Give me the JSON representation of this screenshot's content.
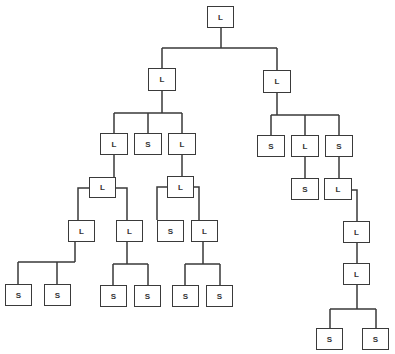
{
  "diagram": {
    "type": "tree",
    "colors": {
      "line": "#3a3a3a",
      "text": "#333333",
      "background": "#ffffff"
    },
    "nodes": [
      {
        "id": "n0",
        "label": "L",
        "x": 207,
        "y": 6,
        "w": 27,
        "h": 22
      },
      {
        "id": "n1",
        "label": "L",
        "x": 148,
        "y": 68,
        "w": 28,
        "h": 23
      },
      {
        "id": "n2",
        "label": "L",
        "x": 263,
        "y": 70,
        "w": 28,
        "h": 23
      },
      {
        "id": "n3",
        "label": "L",
        "x": 100,
        "y": 133,
        "w": 28,
        "h": 22
      },
      {
        "id": "n4",
        "label": "S",
        "x": 134,
        "y": 133,
        "w": 28,
        "h": 22
      },
      {
        "id": "n5",
        "label": "L",
        "x": 168,
        "y": 133,
        "w": 28,
        "h": 22
      },
      {
        "id": "n6",
        "label": "S",
        "x": 257,
        "y": 135,
        "w": 28,
        "h": 22
      },
      {
        "id": "n7",
        "label": "L",
        "x": 291,
        "y": 135,
        "w": 28,
        "h": 22
      },
      {
        "id": "n8",
        "label": "S",
        "x": 325,
        "y": 135,
        "w": 28,
        "h": 22
      },
      {
        "id": "n9",
        "label": "L",
        "x": 89,
        "y": 177,
        "w": 27,
        "h": 21
      },
      {
        "id": "n10",
        "label": "L",
        "x": 167,
        "y": 176,
        "w": 27,
        "h": 22
      },
      {
        "id": "n11",
        "label": "S",
        "x": 291,
        "y": 178,
        "w": 28,
        "h": 22
      },
      {
        "id": "n12",
        "label": "L",
        "x": 324,
        "y": 178,
        "w": 28,
        "h": 22
      },
      {
        "id": "n13",
        "label": "L",
        "x": 68,
        "y": 220,
        "w": 27,
        "h": 22
      },
      {
        "id": "n14",
        "label": "L",
        "x": 116,
        "y": 220,
        "w": 27,
        "h": 22
      },
      {
        "id": "n15",
        "label": "S",
        "x": 157,
        "y": 220,
        "w": 27,
        "h": 22
      },
      {
        "id": "n16",
        "label": "L",
        "x": 191,
        "y": 220,
        "w": 27,
        "h": 22
      },
      {
        "id": "n17",
        "label": "L",
        "x": 343,
        "y": 221,
        "w": 27,
        "h": 22
      },
      {
        "id": "n18",
        "label": "L",
        "x": 343,
        "y": 263,
        "w": 27,
        "h": 22
      },
      {
        "id": "n19",
        "label": "S",
        "x": 5,
        "y": 284,
        "w": 27,
        "h": 22
      },
      {
        "id": "n20",
        "label": "S",
        "x": 44,
        "y": 284,
        "w": 27,
        "h": 22
      },
      {
        "id": "n21",
        "label": "S",
        "x": 100,
        "y": 285,
        "w": 27,
        "h": 22
      },
      {
        "id": "n22",
        "label": "S",
        "x": 134,
        "y": 285,
        "w": 27,
        "h": 22
      },
      {
        "id": "n23",
        "label": "S",
        "x": 172,
        "y": 285,
        "w": 27,
        "h": 22
      },
      {
        "id": "n24",
        "label": "S",
        "x": 206,
        "y": 285,
        "w": 27,
        "h": 22
      },
      {
        "id": "n25",
        "label": "S",
        "x": 316,
        "y": 328,
        "w": 27,
        "h": 22
      },
      {
        "id": "n26",
        "label": "S",
        "x": 362,
        "y": 328,
        "w": 27,
        "h": 22
      }
    ],
    "edges": [
      "M221 28 V48 M162 48 H277 M162 48 V68 M277 48 V70",
      "M162 91 V113 M114 113 H182 M114 113 V133 M148 113 V133 M182 113 V133",
      "M277 93 V115 M271 115 H339 M271 115 V135 M305 115 V135 M339 115 V135",
      "M114 155 V177",
      "M182 155 V176",
      "M305 157 V178",
      "M339 157 V178",
      "M89 188 H78 V220 M116 188 H127 V220",
      "M167 187 H157 V220 M194 187 H199 V220",
      "M352 190 H357 V221",
      "M357 243 V263",
      "M75 242 V262 M18 262 H75 M18 262 V284 M57 262 V284",
      "M127 242 V264 M113 264 H148 M113 264 V285 M148 264 V285",
      "M203 242 V264 M185 264 H220 M185 264 V285 M220 264 V285",
      "M357 285 V309 M330 309 H376 M330 309 V328 M376 309 V328"
    ]
  }
}
